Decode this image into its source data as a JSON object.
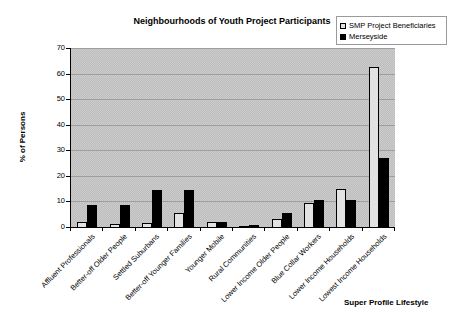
{
  "chart_data": {
    "type": "bar",
    "title": "Neighbourhoods of Youth Project Participants",
    "xlabel": "Super Profile Lifestyle",
    "ylabel": "% of Persons",
    "ylim": [
      0,
      70
    ],
    "ytick_interval": 10,
    "grid": true,
    "legend_position": "top-right",
    "plot_bg": "gray-dither",
    "categories": [
      "Affluent Professionals",
      "Better-off Older People",
      "Settled Suburbans",
      "Better-off Younger Families",
      "Younger Mobile",
      "Rural Communities",
      "Lower Income Older People",
      "Blue Collar Workers",
      "Lower Income Households",
      "Lowest Income Households"
    ],
    "series": [
      {
        "name": "SMP Project Beneficiaries",
        "color": "#e2e2e2",
        "values": [
          2,
          1,
          1.5,
          5.5,
          2,
          0.2,
          3,
          9.5,
          15,
          62.5
        ]
      },
      {
        "name": "Merseyside",
        "color": "#000000",
        "values": [
          8.5,
          8.5,
          14.5,
          14.5,
          2,
          0.8,
          5.5,
          10.5,
          10.5,
          27
        ]
      }
    ]
  },
  "colors": {
    "page_bg": "#ffffff",
    "plot_bg": "#c4c4c4",
    "gridline": "#9e9e9e",
    "axis": "#000000",
    "legend_border": "#9a9a9a"
  }
}
